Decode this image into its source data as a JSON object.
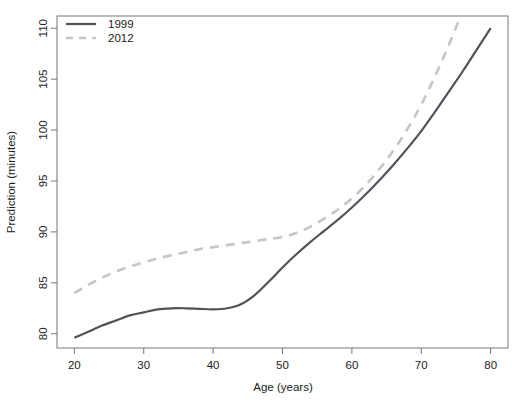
{
  "chart_data": {
    "type": "line",
    "title": "",
    "xlabel": "Age (years)",
    "ylabel": "Prediction (minutes)",
    "xlim": [
      17.5,
      82.5
    ],
    "ylim": [
      78.6,
      111.2
    ],
    "xticks": [
      20,
      30,
      40,
      50,
      60,
      70,
      80
    ],
    "xtick_labels": [
      "20",
      "30",
      "40",
      "50",
      "60",
      "70",
      "80"
    ],
    "yticks": [
      80,
      85,
      90,
      95,
      100,
      105,
      110
    ],
    "ytick_labels": [
      "80",
      "85",
      "90",
      "95",
      "100",
      "105",
      "110"
    ],
    "grid": false,
    "legend_position": "top-left",
    "x": [
      20,
      22,
      24,
      26,
      28,
      30,
      32,
      34,
      36,
      38,
      40,
      42,
      44,
      46,
      48,
      50,
      52,
      54,
      56,
      58,
      60,
      62,
      64,
      66,
      68,
      70,
      72,
      74,
      76,
      78,
      80
    ],
    "series": [
      {
        "name": "1999",
        "label": "1999",
        "color": "#52525a",
        "style": "solid",
        "values": [
          79.6,
          80.2,
          80.8,
          81.3,
          81.8,
          82.1,
          82.4,
          82.5,
          82.5,
          82.45,
          82.4,
          82.5,
          82.9,
          83.8,
          85.1,
          86.5,
          87.8,
          89.0,
          90.1,
          91.2,
          92.4,
          93.7,
          95.1,
          96.6,
          98.2,
          99.9,
          101.8,
          103.8,
          105.8,
          107.9,
          110.0
        ]
      },
      {
        "name": "2012",
        "label": "2012",
        "color": "#c5c5c5",
        "style": "dashed",
        "values": [
          84.0,
          84.8,
          85.5,
          86.1,
          86.6,
          87.0,
          87.4,
          87.7,
          88.0,
          88.3,
          88.5,
          88.7,
          88.9,
          89.1,
          89.3,
          89.5,
          89.9,
          90.5,
          91.3,
          92.2,
          93.3,
          94.6,
          96.2,
          98.0,
          100.1,
          102.5,
          105.3,
          108.4,
          111.8,
          115.5,
          119.5
        ]
      }
    ],
    "annotations": {
      "note_2012_exits_top": "2012 curve exits the top of the plot near age 75",
      "note_crossover": "curves converge near age 58-60"
    }
  },
  "legend": {
    "entries": [
      {
        "label": "1999"
      },
      {
        "label": "2012"
      }
    ]
  }
}
